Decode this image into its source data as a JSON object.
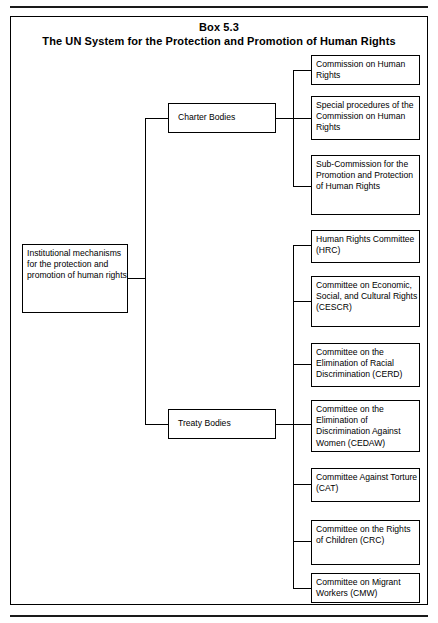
{
  "box": {
    "label": "Box 5.3",
    "title": "The UN System for the Protection and Promotion of Human Rights"
  },
  "diagram": {
    "type": "organizational-tree",
    "root": {
      "id": "institutional-mechanisms",
      "text": "Institutional mechanisms for the protection and promotion of human rights"
    },
    "branches": [
      {
        "id": "charter-bodies",
        "text": "Charter Bodies",
        "children": [
          {
            "id": "commission-on-human-rights",
            "text": "Commission on Human Rights"
          },
          {
            "id": "special-procedures",
            "text": "Special procedures of the Commission on Human Rights"
          },
          {
            "id": "sub-commission",
            "text": "Sub-Commission for the Promotion and Protection of Human Rights"
          }
        ]
      },
      {
        "id": "treaty-bodies",
        "text": "Treaty Bodies",
        "children": [
          {
            "id": "hrc",
            "text": "Human Rights Committee (HRC)"
          },
          {
            "id": "cescr",
            "text": "Committee on Economic, Social, and Cultural Rights (CESCR)"
          },
          {
            "id": "cerd",
            "text": "Committee on the Elimination of Racial Discrimination (CERD)"
          },
          {
            "id": "cedaw",
            "text": "Committee on the Elimination of Discrimination Against Women (CEDAW)"
          },
          {
            "id": "cat",
            "text": "Committee Against Torture (CAT)"
          },
          {
            "id": "crc",
            "text": "Committee on the Rights of Children (CRC)"
          },
          {
            "id": "cmw",
            "text": "Committee on Migrant Workers (CMW)"
          }
        ]
      }
    ]
  },
  "colors": {
    "ink": "#000000",
    "paper": "#ffffff"
  }
}
